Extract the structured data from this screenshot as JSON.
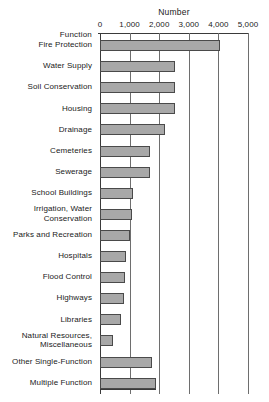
{
  "chart_data": {
    "type": "bar",
    "orientation": "horizontal",
    "title": "Number",
    "xlabel": "Number",
    "ylabel": "Function",
    "xlim": [
      0,
      5000
    ],
    "grid": true,
    "legend": false,
    "tick_labels": [
      "0",
      "1,000",
      "2,000",
      "3,000",
      "4,000",
      "5,000"
    ],
    "tick_values": [
      0,
      1000,
      2000,
      3000,
      4000,
      5000
    ],
    "categories": [
      "Fire Protection",
      "Water Supply",
      "Soil Conservation",
      "Housing",
      "Drainage",
      "Cemeteries",
      "Sewerage",
      "School Buildings",
      "Irrigation, Water Conservation",
      "Parks and Recreation",
      "Hospitals",
      "Flood Control",
      "Highways",
      "Libraries",
      "Natural Resources, Miscellaneous",
      "Other Single-Function",
      "Multiple Function"
    ],
    "values": [
      4050,
      2550,
      2540,
      2530,
      2190,
      1700,
      1690,
      1120,
      1070,
      1030,
      880,
      830,
      800,
      700,
      450,
      1750,
      1900
    ],
    "bar_color": "#a8a8a8",
    "bar_edge_color": "#4a4a4a"
  },
  "axis": {
    "title": "Number",
    "function_header": "Function"
  },
  "rows": [
    {
      "label": "Fire Protection",
      "value": 4050,
      "label_lines": [
        "Fire Protection"
      ]
    },
    {
      "label": "Water Supply",
      "value": 2550,
      "label_lines": [
        "Water Supply"
      ]
    },
    {
      "label": "Soil Conservation",
      "value": 2540,
      "label_lines": [
        "Soil Conservation"
      ]
    },
    {
      "label": "Housing",
      "value": 2530,
      "label_lines": [
        "Housing"
      ]
    },
    {
      "label": "Drainage",
      "value": 2190,
      "label_lines": [
        "Drainage"
      ]
    },
    {
      "label": "Cemeteries",
      "value": 1700,
      "label_lines": [
        "Cemeteries"
      ]
    },
    {
      "label": "Sewerage",
      "value": 1690,
      "label_lines": [
        "Sewerage"
      ]
    },
    {
      "label": "School Buildings",
      "value": 1120,
      "label_lines": [
        "School Buildings"
      ]
    },
    {
      "label": "Irrigation, Water Conservation",
      "value": 1070,
      "label_lines": [
        "Irrigation, Water",
        "Conservation"
      ]
    },
    {
      "label": "Parks and Recreation",
      "value": 1030,
      "label_lines": [
        "Parks and Recreation"
      ]
    },
    {
      "label": "Hospitals",
      "value": 880,
      "label_lines": [
        "Hospitals"
      ]
    },
    {
      "label": "Flood Control",
      "value": 830,
      "label_lines": [
        "Flood Control"
      ]
    },
    {
      "label": "Highways",
      "value": 800,
      "label_lines": [
        "Highways"
      ]
    },
    {
      "label": "Libraries",
      "value": 700,
      "label_lines": [
        "Libraries"
      ]
    },
    {
      "label": "Natural Resources, Miscellaneous",
      "value": 450,
      "label_lines": [
        "Natural Resources,",
        "Miscellaneous"
      ]
    },
    {
      "label": "Other Single-Function",
      "value": 1750,
      "label_lines": [
        "Other Single-Function"
      ]
    },
    {
      "label": "Multiple Function",
      "value": 1900,
      "label_lines": [
        "Multiple Function"
      ]
    }
  ]
}
